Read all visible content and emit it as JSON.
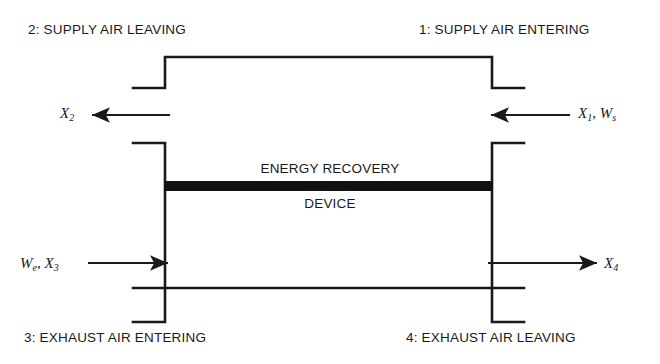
{
  "diagram": {
    "device": {
      "line1": "ENERGY RECOVERY",
      "line2": "DEVICE"
    },
    "port_labels": {
      "supply_leaving": "2: SUPPLY AIR LEAVING",
      "supply_entering": "1: SUPPLY AIR ENTERING",
      "exhaust_entering": "3: EXHAUST AIR ENTERING",
      "exhaust_leaving": "4: EXHAUST AIR LEAVING"
    },
    "streams": [
      {
        "id": "supply-outlet",
        "symbols": "X2",
        "direction": "left",
        "label_parts": [
          {
            "text": "X",
            "style": "italic"
          },
          {
            "text": "2",
            "style": "subscript"
          }
        ]
      },
      {
        "id": "supply-inlet",
        "symbols": "X1, Ws",
        "direction": "left",
        "label_parts": [
          {
            "text": "X",
            "style": "italic"
          },
          {
            "text": "1",
            "style": "subscript"
          },
          {
            "text": ", ",
            "style": "plain"
          },
          {
            "text": "W",
            "style": "italic"
          },
          {
            "text": "s",
            "style": "subscript"
          }
        ]
      },
      {
        "id": "exhaust-inlet",
        "symbols": "We, X3",
        "direction": "right",
        "label_parts": [
          {
            "text": "W",
            "style": "italic"
          },
          {
            "text": "e",
            "style": "subscript"
          },
          {
            "text": ", ",
            "style": "plain"
          },
          {
            "text": "X",
            "style": "italic"
          },
          {
            "text": "3",
            "style": "subscript"
          }
        ]
      },
      {
        "id": "exhaust-outlet",
        "symbols": "X4",
        "direction": "right",
        "label_parts": [
          {
            "text": "X",
            "style": "italic"
          },
          {
            "text": "4",
            "style": "subscript"
          }
        ]
      }
    ],
    "colors": {
      "line": "#1a1a1a",
      "device_bar": "#111111",
      "background": "#ffffff",
      "text": "#1a1a1a"
    }
  }
}
